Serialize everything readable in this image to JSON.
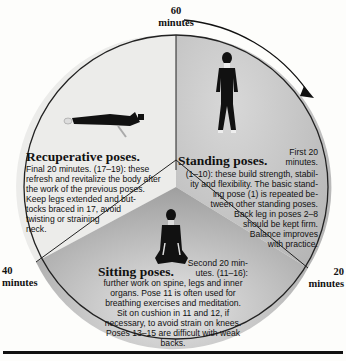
{
  "diagram": {
    "time_labels": {
      "top": {
        "value": "60",
        "unit": "minutes"
      },
      "right": {
        "value": "20",
        "unit": "minutes"
      },
      "left": {
        "value": "40",
        "unit": "minutes"
      }
    },
    "direction_arrow": "clockwise-arrow",
    "segments": [
      {
        "id": "standing",
        "heading": "Standing poses.",
        "time_note": "First 20 minutes.",
        "poses": "(1–10)",
        "text_lines": [
          "First 20",
          "minutes.",
          "(1–10): these build strength, stabil-",
          "ity and flexibility. The basic stand-",
          "ing pose (1) is repeated be-",
          "tween other standing poses.",
          "Back leg in poses 2–8",
          "should be kept firm.",
          "Balance improves",
          "with practice."
        ],
        "figure": "standing-figure",
        "fill": "#bdbdbd"
      },
      {
        "id": "sitting",
        "heading": "Sitting poses.",
        "time_note": "Second 20 minutes.",
        "poses": "(11–16)",
        "text_lines": [
          "Second 20 min-",
          "utes. (11–16):",
          "further work on spine, legs and inner",
          "organs. Pose 11 is often used for",
          "breathing exercises and meditation.",
          "Sit on cushion in 11 and 12, if",
          "necessary, to avoid strain on knees.",
          "Poses 13–15 are difficult with weak",
          "backs."
        ],
        "figure": "kneeling-figure",
        "fill": "#a9a9a9"
      },
      {
        "id": "recuperative",
        "heading": "Recuperative poses.",
        "time_note": "Final 20 minutes.",
        "poses": "(17–19)",
        "text_lines": [
          "Final 20 minutes. (17–19): these",
          "refresh and revitalize the body after",
          "the work of the previous poses.",
          "Keep legs extended and but-",
          "tocks braced in 17, avoid",
          "twisting or straining",
          "neck."
        ],
        "figure": "lying-figure",
        "fill": "#ececea"
      }
    ]
  }
}
